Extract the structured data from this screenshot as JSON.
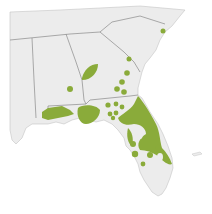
{
  "map": {
    "type": "species-range-map",
    "region": "Southeastern United States",
    "colors": {
      "ocean": "#ffffff",
      "land": "#ececec",
      "border": "#8a8a8a",
      "coast": "#b8b8b8",
      "range": "#8aab3a"
    },
    "states": [
      "Mississippi",
      "Alabama",
      "Georgia",
      "South Carolina",
      "Florida",
      "Tennessee",
      "North Carolina"
    ],
    "legend": []
  }
}
